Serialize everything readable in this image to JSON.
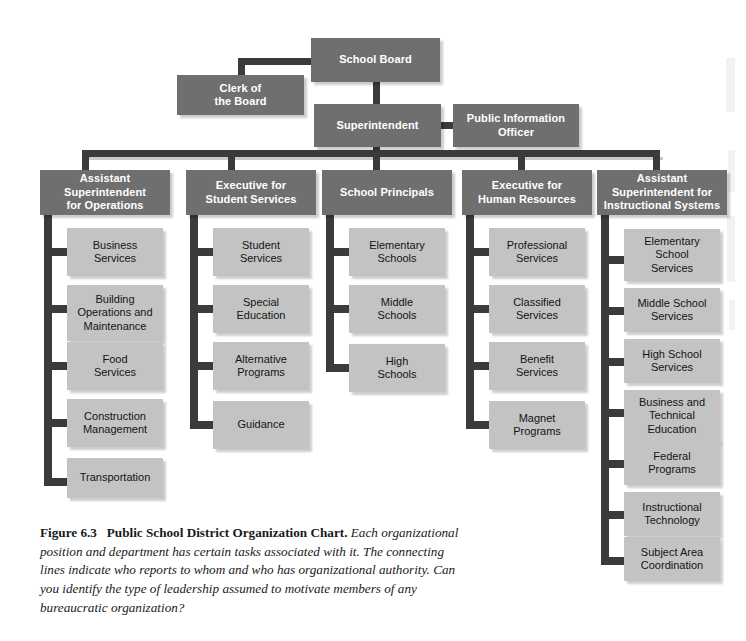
{
  "figure": {
    "label": "Figure 6.3",
    "title": "Public School District Organization Chart.",
    "body": "Each organizational position and department has certain tasks associated with it. The connecting lines indicate who reports to whom and who has organizational authority. Can you identify the type of leadership assumed to motivate members of any bureaucratic organization?"
  },
  "colors": {
    "header_box": "#6f6f6f",
    "unit_box": "#c3c3c3",
    "connector": "#3b3b3b",
    "header_text": "#ffffff",
    "unit_text": "#141414",
    "background": "#ffffff"
  },
  "chart_data": {
    "type": "diagram",
    "diagram_type": "organization-chart",
    "title": "Public School District Organization Chart",
    "root": "School Board",
    "nodes": [
      {
        "id": "school-board",
        "label": "School Board",
        "level": 0,
        "style": "header"
      },
      {
        "id": "clerk-of-the-board",
        "label": "Clerk of the Board",
        "level": 1,
        "style": "header"
      },
      {
        "id": "superintendent",
        "label": "Superintendent",
        "level": 1,
        "style": "header"
      },
      {
        "id": "public-information-officer",
        "label": "Public Information Officer",
        "level": 2,
        "style": "header"
      },
      {
        "id": "assistant-superintendent-for-operations",
        "label": "Assistant Superintendent for Operations",
        "level": 2,
        "style": "header"
      },
      {
        "id": "executive-for-student-services",
        "label": "Executive for Student Services",
        "level": 2,
        "style": "header"
      },
      {
        "id": "school-principals",
        "label": "School Principals",
        "level": 2,
        "style": "header"
      },
      {
        "id": "executive-for-human-resources",
        "label": "Executive for Human Resources",
        "level": 2,
        "style": "header"
      },
      {
        "id": "assistant-superintendent-for-instructional-systems",
        "label": "Assistant Superintendent for Instructional Systems",
        "level": 2,
        "style": "header"
      }
    ],
    "edges": [
      {
        "from": "school-board",
        "to": "clerk-of-the-board"
      },
      {
        "from": "school-board",
        "to": "superintendent"
      },
      {
        "from": "superintendent",
        "to": "public-information-officer"
      },
      {
        "from": "superintendent",
        "to": "assistant-superintendent-for-operations"
      },
      {
        "from": "superintendent",
        "to": "executive-for-student-services"
      },
      {
        "from": "superintendent",
        "to": "school-principals"
      },
      {
        "from": "superintendent",
        "to": "executive-for-human-resources"
      },
      {
        "from": "superintendent",
        "to": "assistant-superintendent-for-instructional-systems"
      }
    ]
  },
  "top": {
    "school_board": "School Board",
    "clerk_of_the_board": "Clerk of\nthe Board",
    "superintendent": "Superintendent",
    "public_information_officer": "Public Information\nOfficer"
  },
  "columns": [
    {
      "id": "operations",
      "head": "Assistant\nSuperintendent\nfor Operations",
      "units": [
        "Business\nServices",
        "Building\nOperations and\nMaintenance",
        "Food\nServices",
        "Construction\nManagement",
        "Transportation"
      ]
    },
    {
      "id": "student-services",
      "head": "Executive for\nStudent Services",
      "units": [
        "Student\nServices",
        "Special\nEducation",
        "Alternative\nPrograms",
        "Guidance"
      ]
    },
    {
      "id": "school-principals",
      "head": "School Principals",
      "units": [
        "Elementary\nSchools",
        "Middle\nSchools",
        "High\nSchools"
      ]
    },
    {
      "id": "human-resources",
      "head": "Executive for\nHuman Resources",
      "units": [
        "Professional\nServices",
        "Classified\nServices",
        "Benefit\nServices",
        "Magnet\nPrograms"
      ]
    },
    {
      "id": "instructional-systems",
      "head": "Assistant\nSuperintendent for\nInstructional Systems",
      "units": [
        "Elementary\nSchool\nServices",
        "Middle School\nServices",
        "High School\nServices",
        "Business and\nTechnical\nEducation",
        "Federal\nPrograms",
        "Instructional\nTechnology",
        "Subject Area\nCoordination"
      ]
    }
  ]
}
